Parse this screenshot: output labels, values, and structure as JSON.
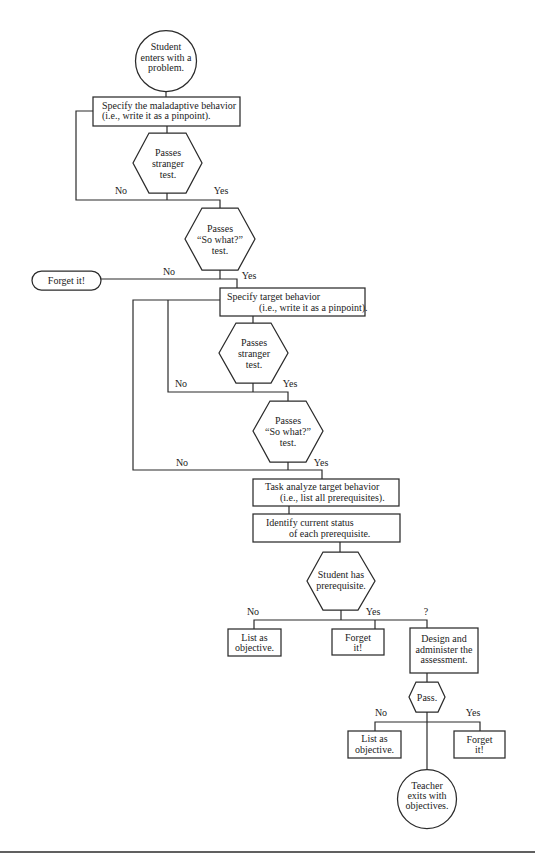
{
  "colors": {
    "line": "#2b2b2b",
    "text": "#222222",
    "background": "#ffffff"
  },
  "diagram": {
    "nodes": {
      "start": {
        "shape": "circle",
        "lines": [
          "Student",
          "enters with a",
          "problem."
        ]
      },
      "specify_maladaptive": {
        "shape": "rectangle",
        "lines": [
          "Specify the maladaptive behavior",
          "(i.e., write it as a pinpoint)."
        ]
      },
      "stranger_test_1": {
        "shape": "hexagon",
        "lines": [
          "Passes",
          "stranger",
          "test."
        ]
      },
      "so_what_test_1": {
        "shape": "hexagon",
        "lines": [
          "Passes",
          "“So what?”",
          "test."
        ]
      },
      "forget_it_terminal": {
        "shape": "terminal",
        "lines": [
          "Forget it!"
        ]
      },
      "specify_target": {
        "shape": "rectangle",
        "lines": [
          "Specify target behavior",
          "(i.e., write it as a pinpoint)."
        ]
      },
      "stranger_test_2": {
        "shape": "hexagon",
        "lines": [
          "Passes",
          "stranger",
          "test."
        ]
      },
      "so_what_test_2": {
        "shape": "hexagon",
        "lines": [
          "Passes",
          "“So what?”",
          "test."
        ]
      },
      "task_analyze": {
        "shape": "rectangle",
        "lines": [
          "Task analyze target behavior",
          "(i.e., list all prerequisites)."
        ]
      },
      "identify_status": {
        "shape": "rectangle",
        "lines": [
          "Identify current status",
          "of each prerequisite."
        ]
      },
      "student_has_prereq": {
        "shape": "hexagon",
        "lines": [
          "Student has",
          "prerequisite."
        ]
      },
      "list_objective_1": {
        "shape": "rectangle",
        "lines": [
          "List as",
          "objective."
        ]
      },
      "forget_it_1": {
        "shape": "rectangle",
        "lines": [
          "Forget",
          "it!"
        ]
      },
      "design_assessment": {
        "shape": "rectangle",
        "lines": [
          "Design and",
          "administer the",
          "assessment."
        ]
      },
      "pass": {
        "shape": "hexagon",
        "lines": [
          "Pass."
        ]
      },
      "list_objective_2": {
        "shape": "rectangle",
        "lines": [
          "List as",
          "objective."
        ]
      },
      "forget_it_2": {
        "shape": "rectangle",
        "lines": [
          "Forget",
          "it!"
        ]
      },
      "end": {
        "shape": "circle",
        "lines": [
          "Teacher",
          "exits with",
          "objectives."
        ]
      }
    },
    "edge_labels": {
      "stranger_1_no": "No",
      "stranger_1_yes": "Yes",
      "so_what_1_no": "No",
      "so_what_1_yes": "Yes",
      "stranger_2_no": "No",
      "stranger_2_yes": "Yes",
      "so_what_2_no": "No",
      "so_what_2_yes": "Yes",
      "prereq_no": "No",
      "prereq_yes": "Yes",
      "prereq_unknown": "?",
      "pass_no": "No",
      "pass_yes": "Yes"
    }
  }
}
